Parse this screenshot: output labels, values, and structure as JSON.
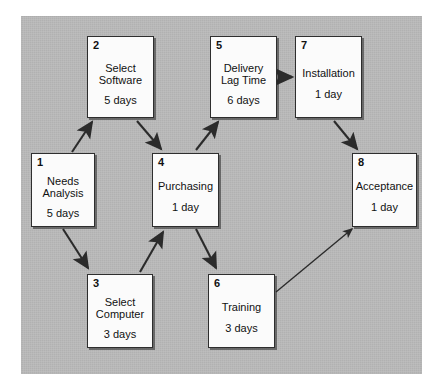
{
  "diagram": {
    "background_color": "#b9b9b9",
    "node_fill_color": "#fbfbfb",
    "node_border_color": "#2e2e2e",
    "arrow_color": "#2b2b2b",
    "nodes": [
      {
        "id": "1",
        "name": "Needs\nAnalysis",
        "duration": "5 days",
        "x": 31,
        "y": 153,
        "w": 64,
        "h": 74
      },
      {
        "id": "2",
        "name": "Select\nSoftware",
        "duration": "5 days",
        "x": 87,
        "y": 36,
        "w": 67,
        "h": 82
      },
      {
        "id": "3",
        "name": "Select\nComputer",
        "duration": "3 days",
        "x": 87,
        "y": 274,
        "w": 66,
        "h": 74
      },
      {
        "id": "4",
        "name": "Purchasing",
        "duration": "1 day",
        "x": 152,
        "y": 153,
        "w": 67,
        "h": 74
      },
      {
        "id": "5",
        "name": "Delivery\nLag Time",
        "duration": "6 days",
        "x": 210,
        "y": 36,
        "w": 67,
        "h": 82
      },
      {
        "id": "6",
        "name": "Training",
        "duration": "3 days",
        "x": 208,
        "y": 274,
        "w": 67,
        "h": 74
      },
      {
        "id": "7",
        "name": "Installation",
        "duration": "1 day",
        "x": 295,
        "y": 36,
        "w": 67,
        "h": 82
      },
      {
        "id": "8",
        "name": "Acceptance",
        "duration": "1 day",
        "x": 352,
        "y": 153,
        "w": 65,
        "h": 74
      }
    ],
    "edges": [
      {
        "from": "1",
        "to": "2",
        "label": ""
      },
      {
        "from": "1",
        "to": "3",
        "label": ""
      },
      {
        "from": "2",
        "to": "4",
        "label": ""
      },
      {
        "from": "3",
        "to": "4",
        "label": ""
      },
      {
        "from": "4",
        "to": "5",
        "label": ""
      },
      {
        "from": "4",
        "to": "6",
        "label": ""
      },
      {
        "from": "5",
        "to": "7",
        "label": ""
      },
      {
        "from": "7",
        "to": "8",
        "label": ""
      },
      {
        "from": "6",
        "to": "8",
        "label": ""
      }
    ]
  }
}
